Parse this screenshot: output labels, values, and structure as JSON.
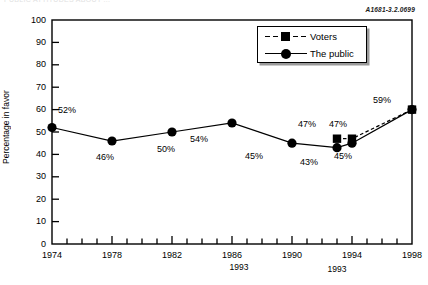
{
  "header_fragment": "PUBLIC ATTITUDES ABOUT ...",
  "ref_code": "A1681-3.2.0699",
  "chart_data": {
    "type": "line",
    "title": "",
    "xlabel": "1993",
    "ylabel": "Percentage in favor",
    "ylim": [
      0,
      100
    ],
    "ytick_step": 10,
    "yticks": [
      "100",
      "90",
      "80",
      "70",
      "60",
      "50",
      "40",
      "30",
      "20",
      "10",
      "0"
    ],
    "xlim": [
      1974,
      1998
    ],
    "xticks": [
      "1974",
      "1978",
      "1982",
      "1986",
      "1990",
      "1994",
      "1998"
    ],
    "x_minor_tick_interval": 1,
    "grid": false,
    "legend_position": "upper right",
    "series": [
      {
        "name": "Voters",
        "marker": "square",
        "linestyle": "dashed",
        "color": "#000000",
        "x": [
          1993,
          1994,
          1998
        ],
        "values": [
          47,
          47,
          60
        ],
        "labels": [
          "47%",
          "47%",
          "59%"
        ]
      },
      {
        "name": "The public",
        "marker": "circle",
        "linestyle": "solid",
        "color": "#000000",
        "x": [
          1974,
          1978,
          1982,
          1986,
          1990,
          1993,
          1994,
          1998
        ],
        "values": [
          52,
          46,
          50,
          54,
          45,
          43,
          45,
          60
        ],
        "labels": [
          "52%",
          "46%",
          "50%",
          "54%",
          "45%",
          "43%",
          "45%",
          "59%"
        ]
      }
    ],
    "point_labels": [
      {
        "text": "52%",
        "x": 58,
        "y": 106
      },
      {
        "text": "46%",
        "x": 96,
        "y": 153
      },
      {
        "text": "50%",
        "x": 157,
        "y": 145
      },
      {
        "text": "54%",
        "x": 190,
        "y": 135
      },
      {
        "text": "45%",
        "x": 245,
        "y": 152
      },
      {
        "text": "43%",
        "x": 300,
        "y": 158
      },
      {
        "text": "47%",
        "x": 298,
        "y": 120
      },
      {
        "text": "47%",
        "x": 329,
        "y": 120
      },
      {
        "text": "45%",
        "x": 334,
        "y": 152
      },
      {
        "text": "59%",
        "x": 373,
        "y": 96
      }
    ]
  }
}
